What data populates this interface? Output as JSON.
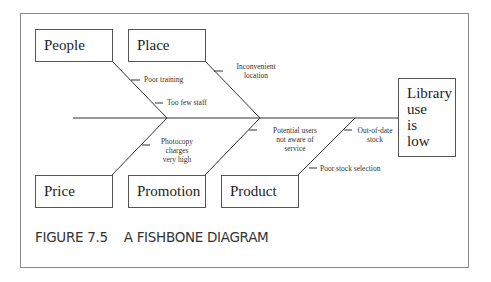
{
  "diagram": {
    "type": "fishbone",
    "effect": {
      "lines": [
        "Library",
        "use",
        "is",
        "low"
      ]
    },
    "categories": [
      {
        "label": "People",
        "causes": [
          "Poor training",
          "Too few staff"
        ]
      },
      {
        "label": "Place",
        "causes": [
          "Inconvenient location"
        ]
      },
      {
        "label": "Price",
        "causes": [
          "Photocopy charges very high"
        ]
      },
      {
        "label": "Promotion",
        "causes": [
          "Potential users not aware of service"
        ]
      },
      {
        "label": "Product",
        "causes": [
          "Out-of-date stock",
          "Poor stock selection"
        ]
      }
    ],
    "cause_text": {
      "poor_training": "Poor training",
      "too_few_staff": "Too few staff",
      "inconvenient_1": "Inconvenient",
      "inconvenient_2": "location",
      "photocopy_1": "Photocopy",
      "photocopy_2": "charges",
      "photocopy_3": "very high",
      "potential_1": "Potential users",
      "potential_2": "not aware of",
      "potential_3": "service",
      "outofdate_1": "Out-of-date",
      "outofdate_2": "stock",
      "poor_stock": "Poor stock selection"
    }
  },
  "caption": "FIGURE 7.5    A FISHBONE DIAGRAM"
}
